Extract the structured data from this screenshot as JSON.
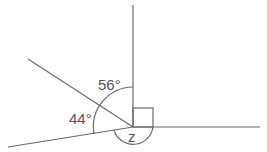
{
  "diagram": {
    "labels": {
      "angle_upper": "56°",
      "angle_lower": "44°",
      "angle_unknown": "z"
    },
    "right_angle_marker": true,
    "colors": {
      "line": "#6a6a6a",
      "text": "#555555",
      "background": "#ffffff"
    }
  }
}
